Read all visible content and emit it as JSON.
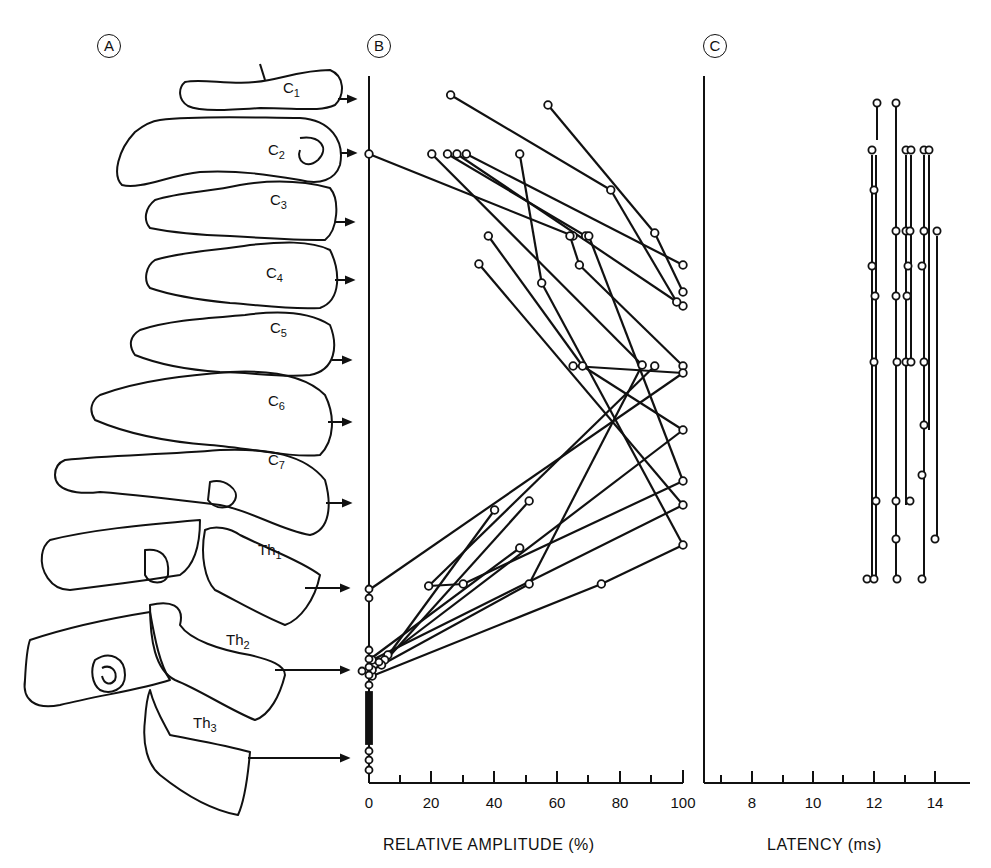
{
  "panels": {
    "A": {
      "letter": "A",
      "vertebrae": [
        {
          "label": "C",
          "sub": "1",
          "y": 104
        },
        {
          "label": "C",
          "sub": "2",
          "y": 153
        },
        {
          "label": "C",
          "sub": "3",
          "y": 222
        },
        {
          "label": "C",
          "sub": "4",
          "y": 280
        },
        {
          "label": "C",
          "sub": "5",
          "y": 360
        },
        {
          "label": "C",
          "sub": "6",
          "y": 422
        },
        {
          "label": "C",
          "sub": "7",
          "y": 503
        },
        {
          "label": "Th",
          "sub": "1",
          "y": 588
        },
        {
          "label": "Th",
          "sub": "2",
          "y": 670
        },
        {
          "label": "Th",
          "sub": "3",
          "y": 758
        }
      ]
    },
    "B": {
      "letter": "B",
      "xlabel": "RELATIVE AMPLITUDE (%)"
    },
    "C": {
      "letter": "C",
      "xlabel": "LATENCY (ms)"
    }
  },
  "chart_data": [
    {
      "type": "line",
      "panel": "B",
      "title": "",
      "xlabel": "RELATIVE AMPLITUDE (%)",
      "ylabel": "",
      "xlim": [
        0,
        100
      ],
      "xticks_major": [
        0,
        20,
        40,
        60,
        80,
        100
      ],
      "xticks_minor": [
        10,
        30,
        50,
        70,
        90
      ],
      "ycategories": [
        "C1",
        "C2",
        "C3",
        "C4",
        "C5",
        "C6",
        "C7",
        "Th1",
        "Th2",
        "Th3"
      ],
      "series_note": "Each line connects amplitude values for one subject at two adjacent recording levels (vertebral levels C1-Th3)",
      "points_px": [
        [
          [
            26,
            95
          ],
          [
            77,
            190
          ]
        ],
        [
          [
            57,
            105
          ],
          [
            91,
            233
          ]
        ],
        [
          [
            0,
            154
          ],
          [
            65,
            236
          ]
        ],
        [
          [
            20,
            154
          ],
          [
            87,
            365
          ]
        ],
        [
          [
            25,
            154
          ],
          [
            69,
            236
          ]
        ],
        [
          [
            28,
            154
          ],
          [
            100,
            306
          ]
        ],
        [
          [
            31,
            154
          ],
          [
            100,
            265
          ]
        ],
        [
          [
            48,
            154
          ],
          [
            55,
            283
          ]
        ],
        [
          [
            38,
            236
          ],
          [
            68,
            366
          ]
        ],
        [
          [
            64,
            236
          ],
          [
            67,
            265
          ]
        ],
        [
          [
            77,
            190
          ],
          [
            98,
            302
          ]
        ],
        [
          [
            91,
            233
          ],
          [
            100,
            292
          ]
        ],
        [
          [
            70,
            236
          ],
          [
            100,
            481
          ]
        ],
        [
          [
            67,
            265
          ],
          [
            100,
            366
          ]
        ],
        [
          [
            55,
            283
          ],
          [
            100,
            545
          ]
        ],
        [
          [
            35,
            264
          ],
          [
            100,
            505
          ]
        ],
        [
          [
            65,
            366
          ],
          [
            100,
            373
          ]
        ],
        [
          [
            68,
            366
          ],
          [
            100,
            430
          ]
        ],
        [
          [
            87,
            365
          ],
          [
            51,
            584
          ]
        ],
        [
          [
            91,
            366
          ],
          [
            19,
            586
          ]
        ],
        [
          [
            100,
            373
          ],
          [
            0,
            590
          ]
        ],
        [
          [
            100,
            430
          ],
          [
            6,
            655
          ]
        ],
        [
          [
            100,
            481
          ],
          [
            30,
            584
          ]
        ],
        [
          [
            100,
            505
          ],
          [
            1,
            660
          ]
        ],
        [
          [
            100,
            545
          ],
          [
            74,
            584
          ]
        ],
        [
          [
            40,
            510
          ],
          [
            5,
            660
          ]
        ],
        [
          [
            51,
            501
          ],
          [
            4,
            665
          ]
        ],
        [
          [
            48,
            548
          ],
          [
            0,
            660
          ]
        ],
        [
          [
            30,
            584
          ],
          [
            19,
            586
          ]
        ],
        [
          [
            74,
            584
          ],
          [
            1,
            676
          ]
        ],
        [
          [
            51,
            584
          ],
          [
            1,
            670
          ]
        ]
      ],
      "zero_values_levels": [
        "Th1",
        "Th2",
        "Th3"
      ]
    },
    {
      "type": "line",
      "panel": "C",
      "title": "",
      "xlabel": "LATENCY (ms)",
      "xlim": [
        6.5,
        15
      ],
      "xticks_major": [
        8,
        10,
        12,
        14
      ],
      "xticks_minor": [
        7,
        9,
        11,
        13
      ],
      "series": [
        {
          "name": "s1",
          "latency_ms": 12.0,
          "levels": [
            "C1",
            "C6"
          ]
        },
        {
          "name": "s2",
          "latency_ms": 11.9,
          "levels": [
            "C2",
            "C4",
            "C5",
            "C7",
            "Th1"
          ]
        },
        {
          "name": "s3",
          "latency_ms": 12.0,
          "levels": [
            "C2",
            "C5",
            "C7",
            "Th1"
          ]
        },
        {
          "name": "s4",
          "latency_ms": 12.7,
          "levels": [
            "C1",
            "C3",
            "C5",
            "C6",
            "C7",
            "Th1"
          ]
        },
        {
          "name": "s5",
          "latency_ms": 13.0,
          "levels": [
            "C2",
            "C4",
            "C5",
            "C6",
            "C7"
          ]
        },
        {
          "name": "s6",
          "latency_ms": 13.1,
          "levels": [
            "C2",
            "C3",
            "C4",
            "C5",
            "C6"
          ]
        },
        {
          "name": "s7",
          "latency_ms": 13.5,
          "levels": [
            "C2",
            "C3",
            "C4",
            "C6",
            "C7",
            "Th1"
          ]
        },
        {
          "name": "s8",
          "latency_ms": 13.7,
          "levels": [
            "C2",
            "C3",
            "C5"
          ]
        },
        {
          "name": "s9",
          "latency_ms": 14.0,
          "levels": [
            "C3",
            "C7"
          ]
        }
      ]
    }
  ]
}
